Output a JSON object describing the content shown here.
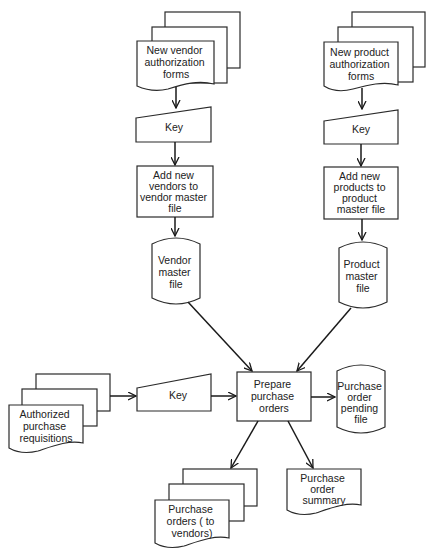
{
  "diagram": {
    "type": "system-flowchart",
    "nodes": {
      "vendor_forms": {
        "shape": "multi-document",
        "lines": [
          "New vendor",
          "authorization",
          "forms"
        ]
      },
      "vendor_key": {
        "shape": "manual-input",
        "lines": [
          "Key"
        ]
      },
      "add_vendors": {
        "shape": "process",
        "lines": [
          "Add new",
          "vendors to",
          "vendor master",
          "file"
        ]
      },
      "vendor_master": {
        "shape": "disk-storage",
        "lines": [
          "Vendor",
          "master",
          "file"
        ]
      },
      "product_forms": {
        "shape": "multi-document",
        "lines": [
          "New product",
          "authorization",
          "forms"
        ]
      },
      "product_key": {
        "shape": "manual-input",
        "lines": [
          "Key"
        ]
      },
      "add_products": {
        "shape": "process",
        "lines": [
          "Add new",
          "products to",
          "product",
          "master file"
        ]
      },
      "product_master": {
        "shape": "disk-storage",
        "lines": [
          "Product",
          "master",
          "file"
        ]
      },
      "requisitions": {
        "shape": "multi-document",
        "lines": [
          "Authorized",
          "purchase",
          "requisitions"
        ]
      },
      "req_key": {
        "shape": "manual-input",
        "lines": [
          "Key"
        ]
      },
      "prepare_po": {
        "shape": "process",
        "lines": [
          "Prepare",
          "purchase",
          "orders"
        ]
      },
      "po_pending": {
        "shape": "disk-storage",
        "lines": [
          "Purchase",
          "order",
          "pending",
          "file"
        ]
      },
      "po_to_vendors": {
        "shape": "multi-document",
        "lines": [
          "Purchase",
          "orders ( to",
          "vendors)"
        ]
      },
      "po_summary": {
        "shape": "document",
        "lines": [
          "Purchase",
          "order",
          "summary"
        ]
      }
    },
    "edges": [
      {
        "from": "vendor_forms",
        "to": "vendor_key"
      },
      {
        "from": "vendor_key",
        "to": "add_vendors"
      },
      {
        "from": "add_vendors",
        "to": "vendor_master"
      },
      {
        "from": "product_forms",
        "to": "product_key"
      },
      {
        "from": "product_key",
        "to": "add_products"
      },
      {
        "from": "add_products",
        "to": "product_master"
      },
      {
        "from": "vendor_master",
        "to": "prepare_po"
      },
      {
        "from": "product_master",
        "to": "prepare_po"
      },
      {
        "from": "requisitions",
        "to": "req_key"
      },
      {
        "from": "req_key",
        "to": "prepare_po"
      },
      {
        "from": "prepare_po",
        "to": "po_pending"
      },
      {
        "from": "prepare_po",
        "to": "po_to_vendors"
      },
      {
        "from": "prepare_po",
        "to": "po_summary"
      }
    ]
  }
}
